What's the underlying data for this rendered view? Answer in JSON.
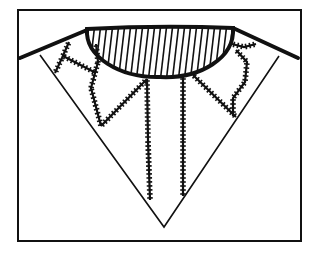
{
  "diagram": {
    "colors": {
      "background": "#ffffff",
      "ink": "#111111"
    },
    "frame": {
      "x": 18,
      "y": 10,
      "width": 283,
      "height": 231
    },
    "neckline": {
      "top_left": [
        87,
        29
      ],
      "top_right": [
        233,
        28
      ],
      "bottom": [
        160,
        77
      ],
      "fill": "vertical-hatching"
    },
    "shoulders": {
      "left": [
        [
          20,
          58
        ],
        [
          87,
          30
        ]
      ],
      "right": [
        [
          233,
          28
        ],
        [
          298,
          58
        ]
      ]
    },
    "v_edges": {
      "left": [
        [
          40,
          55
        ],
        [
          164,
          227
        ]
      ],
      "right": [
        [
          279,
          56
        ],
        [
          164,
          227
        ]
      ],
      "tip": [
        164,
        227
      ]
    },
    "stitch_lines": [
      {
        "name": "left-outer-stitch",
        "points": [
          [
            69,
            42
          ],
          [
            62,
            58
          ],
          [
            55,
            73
          ]
        ]
      },
      {
        "name": "left-cross-stitch",
        "points": [
          [
            63,
            56
          ],
          [
            96,
            73
          ]
        ]
      },
      {
        "name": "left-inner-stitch",
        "points": [
          [
            96,
            44
          ],
          [
            98,
            62
          ],
          [
            91,
            88
          ],
          [
            101,
            126
          ]
        ]
      },
      {
        "name": "left-diagonal-stitch",
        "points": [
          [
            101,
            126
          ],
          [
            147,
            79
          ]
        ]
      },
      {
        "name": "center-left-stitch",
        "points": [
          [
            147,
            79
          ],
          [
            148,
            140
          ],
          [
            150,
            200
          ]
        ]
      },
      {
        "name": "center-right-stitch",
        "points": [
          [
            183,
            77
          ],
          [
            183,
            140
          ],
          [
            183,
            196
          ]
        ]
      },
      {
        "name": "right-diagonal-stitch",
        "points": [
          [
            193,
            75
          ],
          [
            236,
            117
          ]
        ]
      },
      {
        "name": "right-curved-stitch",
        "points": [
          [
            236,
            50
          ],
          [
            247,
            62
          ],
          [
            245,
            82
          ],
          [
            233,
            98
          ],
          [
            233,
            116
          ]
        ]
      },
      {
        "name": "right-shoulder-stitch",
        "points": [
          [
            232,
            44
          ],
          [
            244,
            47
          ],
          [
            256,
            44
          ]
        ]
      }
    ]
  }
}
